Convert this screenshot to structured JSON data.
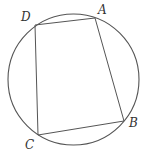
{
  "diagram": {
    "type": "cyclic-quadrilateral-inscribed-in-circle",
    "circle": {
      "cx": 73.5,
      "cy": 79.5,
      "r": 65.5,
      "stroke": "#555555"
    },
    "vertices": [
      {
        "id": "A",
        "label": "A",
        "x": 95,
        "y": 18,
        "label_x": 98,
        "label_y": 14
      },
      {
        "id": "B",
        "label": "B",
        "x": 124,
        "y": 121,
        "label_x": 129,
        "label_y": 127
      },
      {
        "id": "C",
        "label": "C",
        "x": 38,
        "y": 135,
        "label_x": 25,
        "label_y": 149
      },
      {
        "id": "D",
        "label": "D",
        "x": 35,
        "y": 25,
        "label_x": 21,
        "label_y": 21
      }
    ],
    "edges": [
      {
        "id": "AB",
        "from": "A",
        "to": "B"
      },
      {
        "id": "BC",
        "from": "B",
        "to": "C"
      },
      {
        "id": "CD",
        "from": "C",
        "to": "D"
      },
      {
        "id": "DA",
        "from": "D",
        "to": "A"
      }
    ]
  }
}
